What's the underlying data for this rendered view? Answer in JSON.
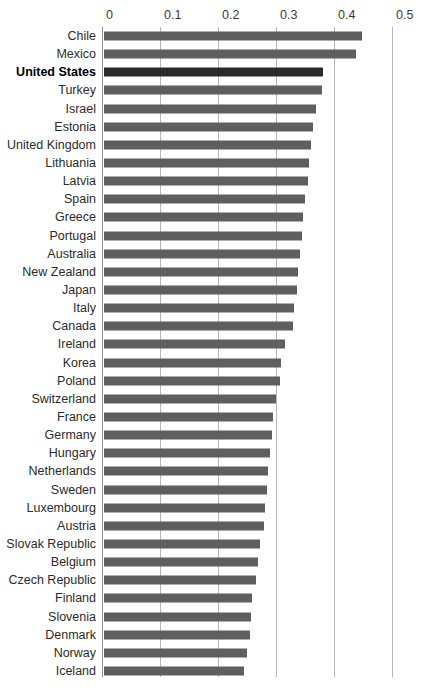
{
  "chart_data": {
    "type": "bar",
    "orientation": "horizontal",
    "title": "",
    "xlabel": "",
    "ylabel": "",
    "xlim": [
      0,
      0.5
    ],
    "xticks": [
      "0",
      "0.1",
      "0.2",
      "0.3",
      "0.4",
      "0.5"
    ],
    "grid": true,
    "legend": null,
    "highlight_category": "United States",
    "bar_color": "#5f5f5f",
    "highlight_bar_color": "#2a2a2a",
    "categories": [
      "Chile",
      "Mexico",
      "United States",
      "Turkey",
      "Israel",
      "Estonia",
      "United Kingdom",
      "Lithuania",
      "Latvia",
      "Spain",
      "Greece",
      "Portugal",
      "Australia",
      "New Zealand",
      "Japan",
      "Italy",
      "Canada",
      "Ireland",
      "Korea",
      "Poland",
      "Switzerland",
      "France",
      "Germany",
      "Hungary",
      "Netherlands",
      "Sweden",
      "Luxembourg",
      "Austria",
      "Slovak Republic",
      "Belgium",
      "Czech Republic",
      "Finland",
      "Slovenia",
      "Denmark",
      "Norway",
      "Iceland"
    ],
    "values": [
      0.444,
      0.434,
      0.378,
      0.375,
      0.365,
      0.361,
      0.357,
      0.354,
      0.352,
      0.347,
      0.343,
      0.341,
      0.338,
      0.335,
      0.332,
      0.328,
      0.326,
      0.312,
      0.305,
      0.303,
      0.296,
      0.292,
      0.289,
      0.287,
      0.283,
      0.281,
      0.278,
      0.276,
      0.269,
      0.265,
      0.262,
      0.256,
      0.253,
      0.251,
      0.246,
      0.241
    ]
  },
  "caption": {
    "text": ""
  }
}
